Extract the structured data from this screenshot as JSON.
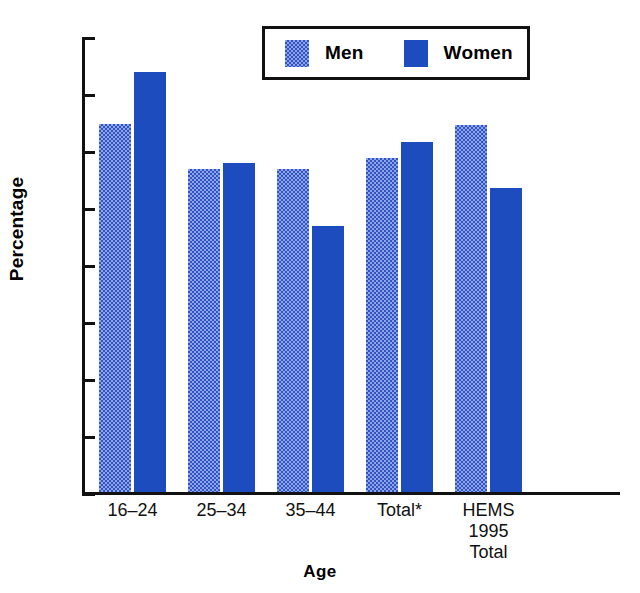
{
  "chart_data": {
    "type": "bar",
    "title": "",
    "xlabel": "Age",
    "ylabel": "Percentage",
    "ylim": [
      0,
      80
    ],
    "yticks": [
      0,
      10,
      20,
      30,
      40,
      50,
      60,
      70,
      80
    ],
    "ytick_labels": [
      "0",
      "10",
      "20",
      "30",
      "40",
      "50",
      "60",
      "70",
      "80"
    ],
    "grid": false,
    "legend_position": "top-right",
    "categories": [
      "16–24",
      "25–34",
      "35–44",
      "Total*",
      "HEMS\n1995\nTotal"
    ],
    "series": [
      {
        "name": "Men",
        "color": "#8fa3e6",
        "pattern": "dotted",
        "values": [
          65,
          57,
          57,
          59,
          64.7
        ]
      },
      {
        "name": "Women",
        "color": "#1d4cbe",
        "pattern": "solid",
        "values": [
          74,
          58,
          47,
          61.8,
          53.7
        ]
      }
    ]
  },
  "legend": {
    "entries": [
      {
        "label": "Men",
        "swatch": "men"
      },
      {
        "label": "Women",
        "swatch": "women"
      }
    ]
  },
  "axes": {
    "y_title": "Percentage",
    "x_title": "Age"
  }
}
